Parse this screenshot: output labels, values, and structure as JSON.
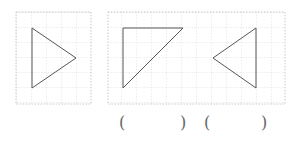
{
  "figures": [
    {
      "id": "fig-a",
      "shape": "triangle-right-pointing",
      "points": [
        [
          32,
          28
        ],
        [
          76,
          58
        ],
        [
          32,
          88
        ]
      ]
    },
    {
      "id": "fig-b",
      "shape": "right-triangle",
      "points": [
        [
          123,
          28
        ],
        [
          183,
          28
        ],
        [
          123,
          88
        ]
      ]
    },
    {
      "id": "fig-c",
      "shape": "triangle-left-pointing",
      "points": [
        [
          256,
          28
        ],
        [
          213,
          58
        ],
        [
          256,
          88
        ]
      ]
    }
  ],
  "panels": [
    {
      "x": 16,
      "y": 12,
      "w": 75,
      "h": 92
    },
    {
      "x": 108,
      "y": 12,
      "w": 177,
      "h": 92
    }
  ],
  "answers": {
    "blank1_open": "(",
    "blank1_close": ")",
    "blank2_open": "(",
    "blank2_close": ")"
  },
  "colors": {
    "grid": "#c8c8c8",
    "shape": "#555555",
    "paren": "#666666"
  }
}
